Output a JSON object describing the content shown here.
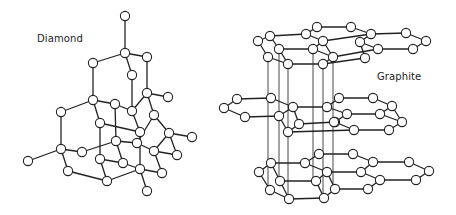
{
  "figure": {
    "panels": [
      {
        "id": "diamond",
        "label": "Diamond"
      },
      {
        "id": "graphite",
        "label": "Graphite"
      }
    ]
  },
  "diamond": {
    "label": "Diamond",
    "atoms": [
      [
        125,
        16
      ],
      [
        125,
        53
      ],
      [
        93,
        63
      ],
      [
        147,
        57
      ],
      [
        132,
        75
      ],
      [
        147,
        93
      ],
      [
        168,
        97
      ],
      [
        93,
        100
      ],
      [
        115,
        104
      ],
      [
        132,
        111
      ],
      [
        154,
        115
      ],
      [
        61,
        112
      ],
      [
        100,
        123
      ],
      [
        140,
        132
      ],
      [
        116,
        141
      ],
      [
        137,
        143
      ],
      [
        169,
        133
      ],
      [
        192,
        137
      ],
      [
        61,
        149
      ],
      [
        82,
        152
      ],
      [
        28,
        161
      ],
      [
        100,
        159
      ],
      [
        123,
        163
      ],
      [
        154,
        151
      ],
      [
        177,
        155
      ],
      [
        68,
        171
      ],
      [
        140,
        169
      ],
      [
        162,
        173
      ],
      [
        107,
        181
      ],
      [
        147,
        191
      ]
    ],
    "bonds": [
      [
        0,
        1
      ],
      [
        1,
        2
      ],
      [
        1,
        3
      ],
      [
        1,
        4
      ],
      [
        2,
        7
      ],
      [
        3,
        5
      ],
      [
        4,
        9
      ],
      [
        5,
        6
      ],
      [
        5,
        10
      ],
      [
        5,
        9
      ],
      [
        7,
        8
      ],
      [
        7,
        11
      ],
      [
        7,
        12
      ],
      [
        8,
        9
      ],
      [
        8,
        14
      ],
      [
        9,
        13
      ],
      [
        10,
        16
      ],
      [
        10,
        15
      ],
      [
        11,
        18
      ],
      [
        12,
        13
      ],
      [
        12,
        21
      ],
      [
        13,
        26
      ],
      [
        14,
        15
      ],
      [
        14,
        22
      ],
      [
        15,
        23
      ],
      [
        16,
        17
      ],
      [
        16,
        23
      ],
      [
        16,
        24
      ],
      [
        18,
        19
      ],
      [
        18,
        20
      ],
      [
        18,
        25
      ],
      [
        19,
        14
      ],
      [
        21,
        22
      ],
      [
        21,
        28
      ],
      [
        22,
        26
      ],
      [
        23,
        24
      ],
      [
        23,
        27
      ],
      [
        25,
        28
      ],
      [
        26,
        27
      ],
      [
        26,
        29
      ],
      [
        26,
        28
      ]
    ]
  },
  "graphite": {
    "label": "Graphite",
    "layers": [
      {
        "name": "top",
        "atoms": [
          [
            270,
            36
          ],
          [
            258,
            41
          ],
          [
            279,
            49
          ],
          [
            268,
            57
          ],
          [
            288,
            64
          ],
          [
            306,
            34
          ],
          [
            317,
            27
          ],
          [
            323,
            41
          ],
          [
            313,
            49
          ],
          [
            323,
            64
          ],
          [
            333,
            57
          ],
          [
            351,
            27
          ],
          [
            371,
            34
          ],
          [
            360,
            42
          ],
          [
            378,
            49
          ],
          [
            365,
            58
          ],
          [
            406,
            33
          ],
          [
            426,
            41
          ],
          [
            413,
            49
          ]
        ],
        "bonds": [
          [
            0,
            1
          ],
          [
            1,
            3
          ],
          [
            3,
            4
          ],
          [
            0,
            2
          ],
          [
            2,
            4
          ],
          [
            0,
            5
          ],
          [
            2,
            8
          ],
          [
            4,
            9
          ],
          [
            5,
            6
          ],
          [
            5,
            7
          ],
          [
            7,
            8
          ],
          [
            8,
            10
          ],
          [
            10,
            9
          ],
          [
            7,
            10
          ],
          [
            6,
            11
          ],
          [
            7,
            12
          ],
          [
            10,
            14
          ],
          [
            9,
            15
          ],
          [
            11,
            12
          ],
          [
            12,
            13
          ],
          [
            13,
            15
          ],
          [
            13,
            14
          ],
          [
            12,
            16
          ],
          [
            14,
            18
          ],
          [
            16,
            17
          ],
          [
            17,
            18
          ]
        ]
      },
      {
        "name": "middle",
        "atoms": [
          [
            237,
            99
          ],
          [
            224,
            108
          ],
          [
            245,
            117
          ],
          [
            271,
            98
          ],
          [
            293,
            107
          ],
          [
            279,
            116
          ],
          [
            299,
            124
          ],
          [
            288,
            132
          ],
          [
            327,
            107
          ],
          [
            339,
            98
          ],
          [
            335,
            122
          ],
          [
            347,
            114
          ],
          [
            354,
            130
          ],
          [
            334,
            122
          ],
          [
            373,
            98
          ],
          [
            392,
            106
          ],
          [
            380,
            114
          ],
          [
            402,
            122
          ],
          [
            389,
            130
          ]
        ],
        "bonds": [
          [
            0,
            1
          ],
          [
            1,
            2
          ],
          [
            0,
            3
          ],
          [
            2,
            5
          ],
          [
            3,
            4
          ],
          [
            4,
            5
          ],
          [
            5,
            7
          ],
          [
            4,
            6
          ],
          [
            6,
            7
          ],
          [
            4,
            8
          ],
          [
            6,
            10
          ],
          [
            7,
            12
          ],
          [
            8,
            9
          ],
          [
            8,
            11
          ],
          [
            11,
            10
          ],
          [
            10,
            12
          ],
          [
            9,
            14
          ],
          [
            11,
            16
          ],
          [
            12,
            18
          ],
          [
            14,
            15
          ],
          [
            15,
            16
          ],
          [
            15,
            17
          ],
          [
            16,
            17
          ],
          [
            17,
            18
          ]
        ]
      },
      {
        "name": "bottom",
        "atoms": [
          [
            271,
            163
          ],
          [
            259,
            172
          ],
          [
            280,
            181
          ],
          [
            270,
            190
          ],
          [
            289,
            199
          ],
          [
            305,
            163
          ],
          [
            319,
            154
          ],
          [
            327,
            172
          ],
          [
            316,
            181
          ],
          [
            335,
            189
          ],
          [
            324,
            198
          ],
          [
            353,
            154
          ],
          [
            373,
            162
          ],
          [
            361,
            172
          ],
          [
            380,
            180
          ],
          [
            368,
            189
          ],
          [
            409,
            162
          ],
          [
            429,
            171
          ],
          [
            416,
            180
          ]
        ],
        "bonds": [
          [
            0,
            1
          ],
          [
            1,
            3
          ],
          [
            3,
            4
          ],
          [
            0,
            2
          ],
          [
            2,
            4
          ],
          [
            0,
            5
          ],
          [
            2,
            8
          ],
          [
            4,
            10
          ],
          [
            5,
            6
          ],
          [
            5,
            7
          ],
          [
            7,
            8
          ],
          [
            8,
            10
          ],
          [
            7,
            9
          ],
          [
            9,
            10
          ],
          [
            6,
            11
          ],
          [
            7,
            13
          ],
          [
            9,
            15
          ],
          [
            11,
            12
          ],
          [
            12,
            13
          ],
          [
            13,
            14
          ],
          [
            14,
            15
          ],
          [
            12,
            16
          ],
          [
            14,
            18
          ],
          [
            16,
            17
          ],
          [
            17,
            18
          ]
        ]
      }
    ],
    "vertical_lines": [
      [
        268,
        57,
        268,
        190
      ],
      [
        279,
        49,
        279,
        181
      ],
      [
        288,
        64,
        288,
        199
      ],
      [
        313,
        49,
        313,
        181
      ],
      [
        323,
        64,
        323,
        198
      ],
      [
        333,
        57,
        333,
        189
      ]
    ]
  }
}
